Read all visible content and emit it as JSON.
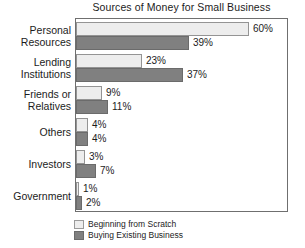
{
  "chart_data": {
    "type": "bar",
    "orientation": "horizontal",
    "title": "Sources of Money for Small Business",
    "xlabel": "",
    "ylabel": "",
    "xlim": [
      0,
      73
    ],
    "grid": false,
    "legend_position": "bottom-left",
    "value_suffix": "%",
    "categories": [
      "Personal Resources",
      "Lending Institutions",
      "Friends or Relatives",
      "Others",
      "Investors",
      "Government"
    ],
    "category_lines": [
      [
        "Personal",
        "Resources"
      ],
      [
        "Lending",
        "Institutions"
      ],
      [
        "Friends or",
        "Relatives"
      ],
      [
        "Others"
      ],
      [
        "Investors"
      ],
      [
        "Government"
      ]
    ],
    "series": [
      {
        "name": "Beginning from Scratch",
        "color": "#ededed",
        "values": [
          60,
          23,
          9,
          4,
          3,
          1
        ],
        "labels": [
          "60%",
          "23%",
          "9%",
          "4%",
          "3%",
          "1%"
        ]
      },
      {
        "name": "Buying Existing Business",
        "color": "#808080",
        "values": [
          39,
          37,
          11,
          4,
          7,
          2
        ],
        "labels": [
          "39%",
          "37%",
          "11%",
          "4%",
          "7%",
          "2%"
        ]
      }
    ]
  },
  "legend": {
    "items": [
      {
        "label": "Beginning from Scratch",
        "swatch": "scratch"
      },
      {
        "label": "Buying Existing Business",
        "swatch": "buying"
      }
    ]
  }
}
